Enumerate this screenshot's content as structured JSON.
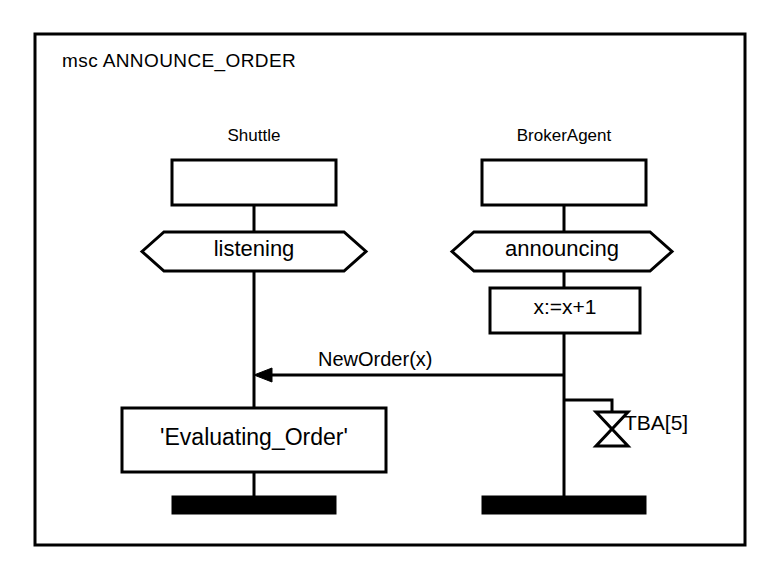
{
  "diagram": {
    "kind": "msc",
    "title": "msc ANNOUNCE_ORDER",
    "frame": {
      "stroke": "#000000",
      "fill": "#ffffff"
    },
    "instances": [
      {
        "id": "shuttle",
        "name": "Shuttle",
        "condition": "listening",
        "state": "'Evaluating_Order'",
        "termination": "stop-bar"
      },
      {
        "id": "brokeragent",
        "name": "BrokerAgent",
        "condition": "announcing",
        "action": "x:=x+1",
        "timer": "TBA[5]",
        "termination": "stop-bar"
      }
    ],
    "messages": [
      {
        "label": "NewOrder(x)",
        "from": "brokeragent",
        "to": "shuttle",
        "direction": "left"
      }
    ],
    "timers": [
      {
        "label": "TBA[5]",
        "owner": "brokeragent",
        "symbol": "hourglass"
      }
    ]
  }
}
